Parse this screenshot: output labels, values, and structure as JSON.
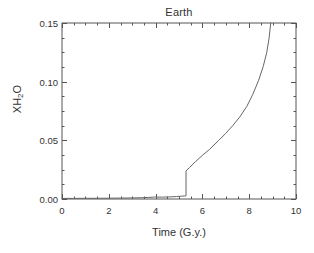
{
  "chart_data": {
    "type": "line",
    "title": "Earth",
    "xlabel": "Time (G.y.)",
    "ylabel": "XH2O",
    "ylabel_base": "XH",
    "ylabel_sub": "2",
    "ylabel_tail": "O",
    "xlim": [
      0,
      10
    ],
    "ylim": [
      0,
      0.15
    ],
    "grid": false,
    "legend": null,
    "line_color": "#666666",
    "frame_color": "#555555",
    "background": "#ffffff",
    "xticks": [
      0,
      2,
      4,
      6,
      8,
      10
    ],
    "xtick_labels": [
      "0",
      "2",
      "4",
      "6",
      "8",
      "10"
    ],
    "x_minor_step": 0.5,
    "yticks": [
      0,
      0.05,
      0.1,
      0.15
    ],
    "ytick_labels": [
      "0.00",
      "0.05",
      "0.10",
      "0.15"
    ],
    "y_minor_step": 0.0125,
    "series": [
      {
        "name": "XH2O",
        "x": [
          0.0,
          0.5,
          1.0,
          1.5,
          2.0,
          2.5,
          3.0,
          3.4,
          3.7,
          3.9,
          4.0,
          4.1,
          4.3,
          4.5,
          4.7,
          4.9,
          5.1,
          5.25,
          5.3,
          5.3,
          5.45,
          5.7,
          6.0,
          6.3,
          6.7,
          7.0,
          7.3,
          7.6,
          7.9,
          8.15,
          8.4,
          8.6,
          8.75,
          8.85,
          8.92
        ],
        "y": [
          0.0005,
          0.0005,
          0.0006,
          0.0006,
          0.0007,
          0.0008,
          0.0009,
          0.0011,
          0.0013,
          0.0016,
          0.0017,
          0.0016,
          0.0016,
          0.0017,
          0.0019,
          0.0021,
          0.0024,
          0.0026,
          0.0027,
          0.024,
          0.0268,
          0.0318,
          0.0372,
          0.0422,
          0.05,
          0.056,
          0.0626,
          0.07,
          0.079,
          0.089,
          0.101,
          0.113,
          0.125,
          0.137,
          0.15
        ]
      }
    ],
    "annotations": []
  },
  "plot_geometry": {
    "left": 62,
    "right": 296,
    "top": 23,
    "bottom": 199
  }
}
